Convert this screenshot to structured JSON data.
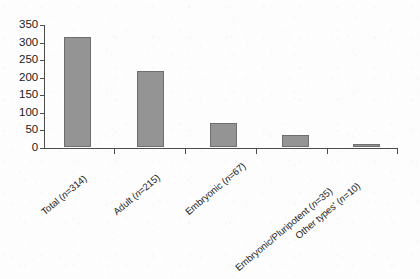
{
  "figure": {
    "kind": "bar-chart",
    "background_color": "#fdfdfd",
    "bar_fill_color": "#949494",
    "bar_edge_color": "#6e6e6e",
    "axis_color": "#4d4d4d"
  },
  "chart_data": {
    "type": "bar",
    "title": "",
    "subtitle": "",
    "xlabel": "",
    "ylabel": "",
    "categories": [
      "Total (n=314)",
      "Adult (n=215)",
      "Embryonic (n=67)",
      "Embryonic/Pluripotent (n=35)",
      "Other types' (n=10)"
    ],
    "category_names": [
      "Total",
      "Adult",
      "Embryonic",
      "Embryonic/Pluripotent",
      "Other types'"
    ],
    "category_counts": [
      314,
      215,
      67,
      35,
      10
    ],
    "values": [
      314,
      215,
      67,
      35,
      10
    ],
    "ylim": [
      0,
      350
    ],
    "ytick_labels": [
      "0",
      "50",
      "100",
      "150",
      "200",
      "250",
      "300",
      "350"
    ],
    "ytick_values": [
      0,
      50,
      100,
      150,
      200,
      250,
      300,
      350
    ],
    "grid": false,
    "legend": null,
    "legend_position": "none",
    "xtick_rotation": -40
  },
  "labels": {
    "items": [
      {
        "prefix": "Total (",
        "italic": "n",
        "suffix": "=314)"
      },
      {
        "prefix": "Adult (",
        "italic": "n",
        "suffix": "=215)"
      },
      {
        "prefix": "Embryonic (",
        "italic": "n",
        "suffix": "=67)"
      },
      {
        "prefix": "Embryonic/Pluripotent (",
        "italic": "n",
        "suffix": "=35)"
      },
      {
        "prefix": "Other types' (",
        "italic": "n",
        "suffix": "=10)"
      }
    ]
  }
}
